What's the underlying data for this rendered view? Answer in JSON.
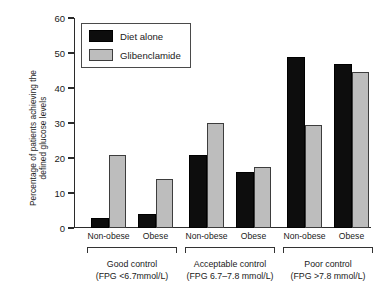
{
  "chart_data": {
    "type": "bar",
    "title": "",
    "subtitle": "",
    "xlabel": "",
    "ylabel": "Percentage of patients achieving the\ndefined glucose levels",
    "ylim": [
      0,
      60
    ],
    "yticks": [
      0,
      10,
      20,
      30,
      40,
      50,
      60
    ],
    "ytick_labels": [
      "0",
      "10",
      "20",
      "30",
      "40",
      "50",
      "60"
    ],
    "grid": false,
    "legend_position": "top-left-inside",
    "categories": [
      "Good control / Non-obese",
      "Good control / Obese",
      "Acceptable control / Non-obese",
      "Acceptable control / Obese",
      "Poor control / Non-obese",
      "Poor control / Obese"
    ],
    "series": [
      {
        "name": "Diet alone",
        "color": "#0d0d0d",
        "values": [
          3,
          4,
          21,
          16,
          49,
          47
        ]
      },
      {
        "name": "Glibenclamide",
        "color": "#bdbdbd",
        "values": [
          21,
          14,
          30,
          17.5,
          29.5,
          44.5
        ]
      }
    ],
    "groups": [
      {
        "caption_line1": "Good control",
        "caption_line2": "(FPG <6.7mmol/L)",
        "subgroups": [
          "Non-obese",
          "Obese"
        ]
      },
      {
        "caption_line1": "Acceptable control",
        "caption_line2": "(FPG 6.7–7.8 mmol/L)",
        "subgroups": [
          "Non-obese",
          "Obese"
        ]
      },
      {
        "caption_line1": "Poor control",
        "caption_line2": "(FPG >7.8 mmol/L)",
        "subgroups": [
          "Non-obese",
          "Obese"
        ]
      }
    ]
  },
  "legend": {
    "entries": [
      {
        "label": "Diet alone",
        "swatch": "diet-swatch"
      },
      {
        "label": "Glibenclamide",
        "swatch": "glibenclamide-swatch"
      }
    ]
  },
  "axis": {
    "y_title": "Percentage of patients achieving the\ndefined glucose levels",
    "ytick_labels": [
      "60",
      "50",
      "40",
      "30",
      "20",
      "10",
      "0"
    ]
  },
  "colors": {
    "diet_alone": "#0d0d0d",
    "glibenclamide": "#bdbdbd",
    "axis": "#2b2b2b",
    "text": "#1a1a1a",
    "background": "#ffffff"
  }
}
